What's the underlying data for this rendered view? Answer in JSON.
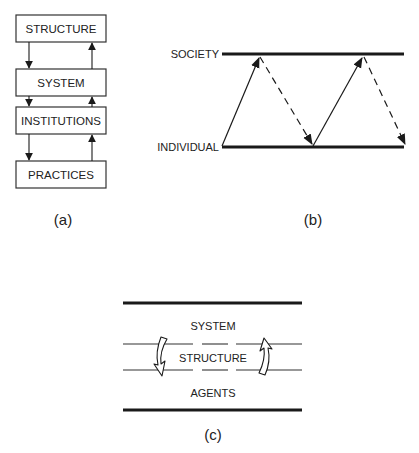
{
  "diagram_a": {
    "caption": "(a)",
    "boxes": [
      {
        "label": "STRUCTURE"
      },
      {
        "label": "SYSTEM"
      },
      {
        "label": "INSTITUTIONS"
      },
      {
        "label": "PRACTICES"
      }
    ],
    "arrows": "downward arrows on left side, upward arrows on right side between each adjacent pair of boxes"
  },
  "diagram_b": {
    "caption": "(b)",
    "levels": {
      "top": "SOCIETY",
      "bottom": "INDIVIDUAL"
    },
    "arrows": "solid arrows rise from INDIVIDUAL to SOCIETY, dashed arrows descend from SOCIETY to INDIVIDUAL, repeated twice in a zig-zag"
  },
  "diagram_c": {
    "caption": "(c)",
    "layers": [
      {
        "label": "SYSTEM"
      },
      {
        "label": "STRUCTURE"
      },
      {
        "label": "AGENTS"
      }
    ],
    "arrows": "curved hollow arrow pointing down on the left, curved hollow arrow pointing up on the right, crossing the STRUCTURE band"
  }
}
